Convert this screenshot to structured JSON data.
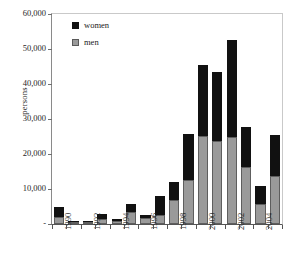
{
  "chart_data": {
    "type": "bar",
    "title": "",
    "subtitle": "",
    "xlabel": "",
    "ylabel": "persons",
    "stacked": true,
    "grid": false,
    "legend_position": "top-left",
    "ylim": [
      0,
      60000
    ],
    "ytick_values": [
      0,
      10000,
      20000,
      30000,
      40000,
      50000,
      60000
    ],
    "ytick_labels": [
      "-",
      "10,000",
      "20,000",
      "30,000",
      "40,000",
      "50,000",
      "60,000"
    ],
    "categories": [
      "1990",
      "1991",
      "1992",
      "1993",
      "1994",
      "1995",
      "1996",
      "1997",
      "1998",
      "1999",
      "2000",
      "2001",
      "2002",
      "2003",
      "2004",
      "2005"
    ],
    "xtick_labels_shown": [
      "1990",
      "1992",
      "1994",
      "1996",
      "1998",
      "2000",
      "2002",
      "2004"
    ],
    "series": [
      {
        "name": "men",
        "color": "#9a9a9a",
        "values": [
          2000,
          700,
          700,
          1500,
          900,
          3300,
          1800,
          2700,
          6800,
          12700,
          25200,
          23600,
          25000,
          16400,
          5700,
          13700
        ]
      },
      {
        "name": "women",
        "color": "#111111",
        "values": [
          2900,
          200,
          200,
          1300,
          400,
          2400,
          900,
          5200,
          5100,
          13100,
          20100,
          19900,
          27500,
          11300,
          5100,
          11700
        ]
      }
    ],
    "totals": [
      4900,
      900,
      900,
      2800,
      1300,
      5700,
      2700,
      7900,
      11900,
      25800,
      45300,
      43500,
      52500,
      27700,
      10800,
      25400
    ]
  },
  "legend": {
    "entries": [
      {
        "label": "women",
        "swatch": "black-square"
      },
      {
        "label": "men",
        "swatch": "gray-square"
      }
    ]
  },
  "axes": {
    "y_title": "persons"
  }
}
